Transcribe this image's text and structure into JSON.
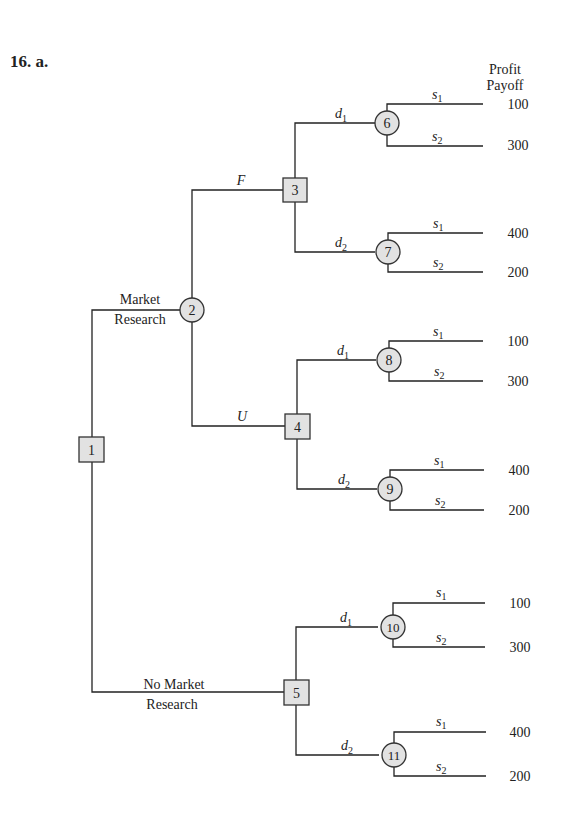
{
  "heading": "16. a.",
  "column_header": {
    "line1": "Profit",
    "line2": "Payoff"
  },
  "colors": {
    "line": "#222222",
    "node_fill": "#e2e2e2",
    "node_stroke": "#333333",
    "background": "#ffffff"
  },
  "nodes": [
    {
      "id": "1",
      "type": "decision",
      "label": "1"
    },
    {
      "id": "2",
      "type": "chance",
      "label": "2"
    },
    {
      "id": "3",
      "type": "decision",
      "label": "3"
    },
    {
      "id": "4",
      "type": "decision",
      "label": "4"
    },
    {
      "id": "5",
      "type": "decision",
      "label": "5"
    },
    {
      "id": "6",
      "type": "chance",
      "label": "6"
    },
    {
      "id": "7",
      "type": "chance",
      "label": "7"
    },
    {
      "id": "8",
      "type": "chance",
      "label": "8"
    },
    {
      "id": "9",
      "type": "chance",
      "label": "9"
    },
    {
      "id": "10",
      "type": "chance",
      "label": "10"
    },
    {
      "id": "11",
      "type": "chance",
      "label": "11"
    }
  ],
  "branches": {
    "market_research": {
      "line1": "Market",
      "line2": "Research"
    },
    "no_market_research": {
      "line1": "No Market",
      "line2": "Research"
    },
    "favorable": "F",
    "unfavorable": "U",
    "d1": "d",
    "d2": "d",
    "d1_sub": "1",
    "d2_sub": "2",
    "s1": "s",
    "s2": "s",
    "s1_sub": "1",
    "s2_sub": "2"
  },
  "payoffs": [
    {
      "node": "6",
      "s1": "100",
      "s2": "300"
    },
    {
      "node": "7",
      "s1": "400",
      "s2": "200"
    },
    {
      "node": "8",
      "s1": "100",
      "s2": "300"
    },
    {
      "node": "9",
      "s1": "400",
      "s2": "200"
    },
    {
      "node": "10",
      "s1": "100",
      "s2": "300"
    },
    {
      "node": "11",
      "s1": "400",
      "s2": "200"
    }
  ]
}
